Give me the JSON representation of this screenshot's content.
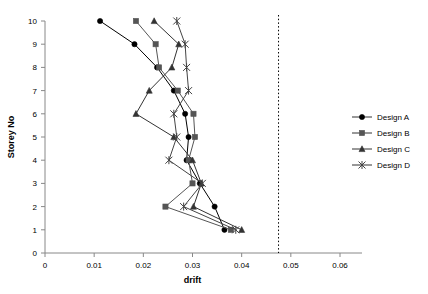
{
  "chart_data": {
    "type": "line",
    "title": "",
    "xlabel": "drift",
    "ylabel": "Storey No",
    "xlim": [
      0,
      0.06
    ],
    "ylim": [
      0,
      10
    ],
    "xticks": [
      "0",
      "0.01",
      "0.02",
      "0.03",
      "0.04",
      "0.05",
      "0.06"
    ],
    "xtick_values": [
      0,
      0.01,
      0.02,
      0.03,
      0.04,
      0.05,
      0.06
    ],
    "yticks": [
      "0",
      "1",
      "2",
      "3",
      "4",
      "5",
      "6",
      "7",
      "8",
      "9",
      "10"
    ],
    "ytick_values": [
      0,
      1,
      2,
      3,
      4,
      5,
      6,
      7,
      8,
      9,
      10
    ],
    "grid": false,
    "legend_position": "right",
    "orientation": "x=drift, y=storey",
    "reference_line": {
      "name": "limit-line",
      "axis": "x",
      "value": 0.0475,
      "style": "dotted"
    },
    "series": [
      {
        "name": "Design A",
        "marker": "circle",
        "color": "#000000",
        "x": [
          0.0365,
          0.0345,
          0.0315,
          0.0295,
          0.0288,
          0.0282,
          0.0262,
          0.024,
          0.0215,
          0.0155,
          0.0112
        ],
        "y": [
          1,
          2,
          3,
          4,
          5,
          6,
          7,
          8,
          9,
          10,
          10
        ],
        "points": [
          {
            "storey": 1,
            "drift": 0.0365
          },
          {
            "storey": 2,
            "drift": 0.0345
          },
          {
            "storey": 3,
            "drift": 0.0315
          },
          {
            "storey": 4,
            "drift": 0.0288
          },
          {
            "storey": 5,
            "drift": 0.0292
          },
          {
            "storey": 6,
            "drift": 0.0285
          },
          {
            "storey": 7,
            "drift": 0.0262
          },
          {
            "storey": 8,
            "drift": 0.0228
          },
          {
            "storey": 9,
            "drift": 0.0182
          },
          {
            "storey": 10,
            "drift": 0.0112
          }
        ]
      },
      {
        "name": "Design B",
        "marker": "square",
        "color": "#555555",
        "points": [
          {
            "storey": 1,
            "drift": 0.0378
          },
          {
            "storey": 2,
            "drift": 0.0245
          },
          {
            "storey": 3,
            "drift": 0.03
          },
          {
            "storey": 4,
            "drift": 0.0292
          },
          {
            "storey": 5,
            "drift": 0.0305
          },
          {
            "storey": 6,
            "drift": 0.0302
          },
          {
            "storey": 7,
            "drift": 0.027
          },
          {
            "storey": 8,
            "drift": 0.0232
          },
          {
            "storey": 9,
            "drift": 0.0225
          },
          {
            "storey": 10,
            "drift": 0.0185
          }
        ]
      },
      {
        "name": "Design C",
        "marker": "triangle",
        "color": "#333333",
        "points": [
          {
            "storey": 1,
            "drift": 0.04
          },
          {
            "storey": 2,
            "drift": 0.0302
          },
          {
            "storey": 3,
            "drift": 0.0318
          },
          {
            "storey": 4,
            "drift": 0.03
          },
          {
            "storey": 5,
            "drift": 0.0262
          },
          {
            "storey": 6,
            "drift": 0.0185
          },
          {
            "storey": 7,
            "drift": 0.0212
          },
          {
            "storey": 8,
            "drift": 0.0258
          },
          {
            "storey": 9,
            "drift": 0.0272
          },
          {
            "storey": 10,
            "drift": 0.0222
          }
        ]
      },
      {
        "name": "Design D",
        "marker": "star",
        "color": "#444444",
        "points": [
          {
            "storey": 1,
            "drift": 0.0388
          },
          {
            "storey": 2,
            "drift": 0.0282
          },
          {
            "storey": 3,
            "drift": 0.032
          },
          {
            "storey": 4,
            "drift": 0.0252
          },
          {
            "storey": 5,
            "drift": 0.0268
          },
          {
            "storey": 6,
            "drift": 0.0262
          },
          {
            "storey": 7,
            "drift": 0.0292
          },
          {
            "storey": 8,
            "drift": 0.0288
          },
          {
            "storey": 9,
            "drift": 0.0285
          },
          {
            "storey": 10,
            "drift": 0.0268
          }
        ]
      }
    ]
  },
  "legend": {
    "items": [
      {
        "label": "Design A",
        "marker": "circle"
      },
      {
        "label": "Design B",
        "marker": "square"
      },
      {
        "label": "Design C",
        "marker": "triangle"
      },
      {
        "label": "Design D",
        "marker": "star"
      }
    ]
  },
  "axes": {
    "x_title": "drift",
    "y_title": "Storey No"
  }
}
